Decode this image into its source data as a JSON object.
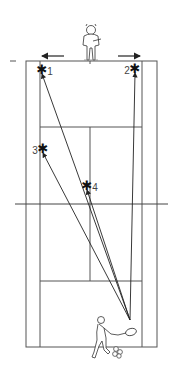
{
  "diagram": {
    "type": "tennis-court-drill",
    "court": {
      "outer": {
        "x1": 26,
        "y1": 61,
        "x2": 157,
        "y2": 347
      },
      "singles_left": 40,
      "singles_right": 142,
      "center_x": 90,
      "service_top": 127,
      "service_bottom": 281,
      "net_y": 204,
      "net_x1": 15,
      "net_x2": 168,
      "line_color": "#555555"
    },
    "origin": {
      "x": 130,
      "y": 320
    },
    "targets": [
      {
        "label": "1",
        "x": 42,
        "y": 70,
        "label_pos": "right"
      },
      {
        "label": "2",
        "x": 135,
        "y": 69,
        "label_pos": "left"
      },
      {
        "label": "3",
        "x": 43,
        "y": 149,
        "label_pos": "left"
      },
      {
        "label": "4",
        "x": 87,
        "y": 186,
        "label_pos": "right"
      }
    ],
    "opponent": {
      "description": "player at far baseline",
      "x": 91,
      "y": 30
    },
    "movement_arrows": [
      {
        "direction": "left",
        "x1": 64,
        "x2": 42,
        "y": 56
      },
      {
        "direction": "right",
        "x1": 118,
        "x2": 140,
        "y": 56
      }
    ],
    "hitter": {
      "description": "player hitting forehand",
      "x": 102,
      "y": 343
    },
    "balls": {
      "count": 3,
      "x": 117,
      "y": 352
    },
    "marker": "-"
  }
}
